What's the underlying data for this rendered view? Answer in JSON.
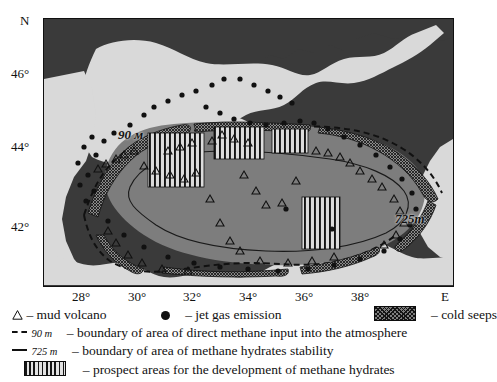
{
  "figure": {
    "kind": "thematic-map",
    "region": "Black Sea"
  },
  "axes": {
    "lat_axis_label": "N",
    "lon_axis_label": "E",
    "lat_ticks": [
      {
        "label": "46°",
        "value": 46
      },
      {
        "label": "44°",
        "value": 44
      },
      {
        "label": "42°",
        "value": 42
      }
    ],
    "lon_ticks": [
      {
        "label": "28°",
        "value": 28
      },
      {
        "label": "30°",
        "value": 30
      },
      {
        "label": "32°",
        "value": 32
      },
      {
        "label": "34°",
        "value": 34
      },
      {
        "label": "36°",
        "value": 36
      },
      {
        "label": "38°",
        "value": 38
      }
    ]
  },
  "map_annotations": {
    "contour_90": "90 м",
    "contour_725": "725m"
  },
  "legend": {
    "row1": {
      "mud_volcano_symbol": "triangle-outline",
      "mud_volcano_label": "– mud volcano",
      "jet_gas_symbol": "filled-dot",
      "jet_gas_label": "– jet gas emission",
      "cold_seeps_symbol": "crosshatch-swatch",
      "cold_seeps_label": "– cold seeps"
    },
    "row2": {
      "line_symbol": "dashed-line",
      "depth": "90 m",
      "label": "– boundary of area of direct methane input into the atmosphere"
    },
    "row3": {
      "line_symbol": "solid-line",
      "depth": "725 m",
      "label": "– boundary of area of methane hydrates stability"
    },
    "row4": {
      "swatch_symbol": "vertical-stripes-swatch",
      "label": "– prospect areas for the development of methane hydrates"
    }
  },
  "colors": {
    "background_dark": "#3a3a3a",
    "land": "#d9d9d9",
    "sea_basin": "#7d7d7d",
    "frame": "#101010",
    "text": "#111111"
  }
}
